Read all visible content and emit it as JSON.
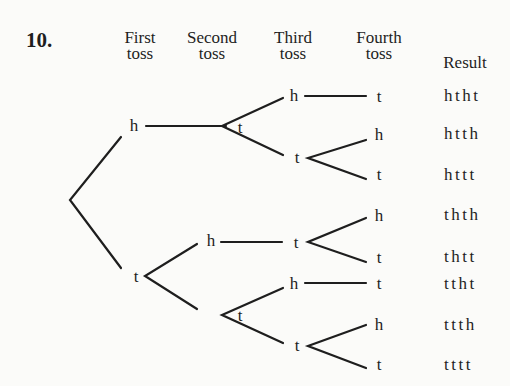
{
  "problem_number": "10.",
  "headers": {
    "first": [
      "First",
      "toss"
    ],
    "second": [
      "Second",
      "toss"
    ],
    "third": [
      "Third",
      "toss"
    ],
    "fourth": [
      "Fourth",
      "toss"
    ],
    "result": "Result"
  },
  "nodes": {
    "l1_h": "h",
    "l1_t": "t",
    "l2_t_from_h": "t",
    "l2_h_from_t": "h",
    "l2_t_from_t": "t",
    "l3_h1": "h",
    "l3_t1": "t",
    "l3_t2": "t",
    "l3_h3": "h",
    "l3_t3": "t",
    "l4_1": "t",
    "l4_2": "h",
    "l4_3": "t",
    "l4_4": "h",
    "l4_5": "t",
    "l4_6": "t",
    "l4_7": "h",
    "l4_8": "t"
  },
  "results": [
    "htht",
    "htth",
    "httt",
    "thth",
    "thtt",
    "ttht",
    "ttth",
    "tttt"
  ]
}
